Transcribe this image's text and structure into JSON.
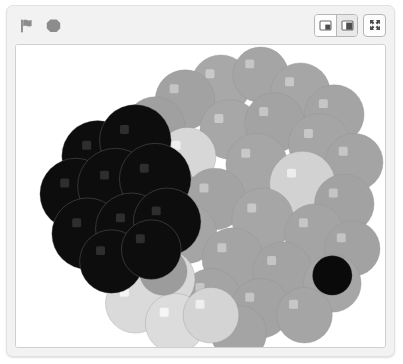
{
  "app": {
    "name": "scratch-stage-panel",
    "background_color": "#f2f2f2",
    "panel_border_color": "#e2e2e2"
  },
  "toolbar": {
    "green_flag": {
      "label": "Go",
      "icon": "green-flag-icon",
      "color": "#8c8c8c"
    },
    "stop": {
      "label": "Stop",
      "icon": "stop-octagon-icon",
      "color": "#8c8c8c"
    },
    "small_stage": {
      "label": "Small stage layout",
      "icon": "small-stage-icon",
      "selected": false
    },
    "large_stage": {
      "label": "Normal stage layout",
      "icon": "large-stage-icon",
      "selected": true
    },
    "fullscreen": {
      "label": "Full screen control",
      "icon": "fullscreen-arrows-icon",
      "selected": false
    }
  },
  "stage": {
    "name": "stage-canvas",
    "background_color": "#ffffff",
    "border_color": "#cfcfcf",
    "width": 371,
    "height": 304,
    "artwork": {
      "title": "Stamped circle cluster",
      "description": "Many overlapping pen-stamped circles in shades of gray, each with a small light square highlight offset up and left of center.",
      "highlight_offset": {
        "x": -11,
        "y": -11
      },
      "highlight_size": 9,
      "palette": {
        "black": "#080808",
        "dark": "#202020",
        "mid_gray": "#9b9b9b",
        "gray": "#a8a8a8",
        "light_gray": "#c2c2c2",
        "pale": "#d9d9d9",
        "near_white": "#efefef",
        "white_tint": "#f7f7f7",
        "outline": "#8f8f8f"
      },
      "stamps": [
        {
          "cx": 206,
          "cy": 40,
          "r": 30,
          "fill": "#a8a8a8",
          "hl": "#c9c9c9"
        },
        {
          "cx": 246,
          "cy": 30,
          "r": 28,
          "fill": "#a5a5a5",
          "hl": "#c6c6c6"
        },
        {
          "cx": 170,
          "cy": 55,
          "r": 30,
          "fill": "#a2a2a2",
          "hl": "#c4c4c4"
        },
        {
          "cx": 286,
          "cy": 48,
          "r": 30,
          "fill": "#a6a6a6",
          "hl": "#c8c8c8"
        },
        {
          "cx": 320,
          "cy": 70,
          "r": 30,
          "fill": "#a4a4a4",
          "hl": "#c6c6c6"
        },
        {
          "cx": 140,
          "cy": 82,
          "r": 30,
          "fill": "#a0a0a0",
          "hl": "#c3c3c3"
        },
        {
          "cx": 215,
          "cy": 85,
          "r": 30,
          "fill": "#a7a7a7",
          "hl": "#c9c9c9"
        },
        {
          "cx": 260,
          "cy": 78,
          "r": 30,
          "fill": "#a3a3a3",
          "hl": "#c5c5c5"
        },
        {
          "cx": 305,
          "cy": 100,
          "r": 31,
          "fill": "#a5a5a5",
          "hl": "#c7c7c7"
        },
        {
          "cx": 340,
          "cy": 118,
          "r": 29,
          "fill": "#a4a4a4",
          "hl": "#c6c6c6"
        },
        {
          "cx": 172,
          "cy": 112,
          "r": 29,
          "fill": "#d7d7d7",
          "hl": "#efefef"
        },
        {
          "cx": 242,
          "cy": 120,
          "r": 31,
          "fill": "#a6a6a6",
          "hl": "#c8c8c8"
        },
        {
          "cx": 288,
          "cy": 140,
          "r": 33,
          "fill": "#d2d2d2",
          "hl": "#ededed"
        },
        {
          "cx": 330,
          "cy": 160,
          "r": 30,
          "fill": "#a2a2a2",
          "hl": "#c4c4c4"
        },
        {
          "cx": 150,
          "cy": 145,
          "r": 30,
          "fill": "#a4a4a4",
          "hl": "#c6c6c6"
        },
        {
          "cx": 200,
          "cy": 155,
          "r": 31,
          "fill": "#a3a3a3",
          "hl": "#c5c5c5"
        },
        {
          "cx": 248,
          "cy": 175,
          "r": 31,
          "fill": "#a6a6a6",
          "hl": "#c8c8c8"
        },
        {
          "cx": 300,
          "cy": 190,
          "r": 30,
          "fill": "#a4a4a4",
          "hl": "#c6c6c6"
        },
        {
          "cx": 338,
          "cy": 205,
          "r": 28,
          "fill": "#a2a2a2",
          "hl": "#c4c4c4"
        },
        {
          "cx": 172,
          "cy": 190,
          "r": 30,
          "fill": "#a5a5a5",
          "hl": "#c7c7c7"
        },
        {
          "cx": 218,
          "cy": 215,
          "r": 31,
          "fill": "#a4a4a4",
          "hl": "#c6c6c6"
        },
        {
          "cx": 268,
          "cy": 228,
          "r": 30,
          "fill": "#a3a3a3",
          "hl": "#c5c5c5"
        },
        {
          "cx": 318,
          "cy": 240,
          "r": 29,
          "fill": "#a6a6a6",
          "hl": "#c8c8c8"
        },
        {
          "cx": 318,
          "cy": 232,
          "r": 20,
          "fill": "#0a0a0a",
          "hl": "#0a0a0a"
        },
        {
          "cx": 196,
          "cy": 255,
          "r": 30,
          "fill": "#a4a4a4",
          "hl": "#c6c6c6"
        },
        {
          "cx": 246,
          "cy": 265,
          "r": 30,
          "fill": "#a3a3a3",
          "hl": "#c5c5c5"
        },
        {
          "cx": 290,
          "cy": 272,
          "r": 28,
          "fill": "#a5a5a5",
          "hl": "#c7c7c7"
        },
        {
          "cx": 224,
          "cy": 290,
          "r": 28,
          "fill": "#a4a4a4",
          "hl": "#c6c6c6"
        },
        {
          "cx": 150,
          "cy": 236,
          "r": 30,
          "fill": "#d8d8d8",
          "hl": "#f2f2f2"
        },
        {
          "cx": 120,
          "cy": 260,
          "r": 30,
          "fill": "#dadada",
          "hl": "#f4f4f4"
        },
        {
          "cx": 160,
          "cy": 280,
          "r": 30,
          "fill": "#dcdcdc",
          "hl": "#f5f5f5"
        },
        {
          "cx": 196,
          "cy": 272,
          "r": 28,
          "fill": "#d4d4d4",
          "hl": "#eeeeee"
        },
        {
          "cx": 148,
          "cy": 228,
          "r": 24,
          "fill": "#9c9c9c",
          "hl": "#bcbcbc"
        },
        {
          "cx": 82,
          "cy": 112,
          "r": 36,
          "fill": "#0d0d0d",
          "hl": "#2e2e2e"
        },
        {
          "cx": 120,
          "cy": 96,
          "r": 36,
          "fill": "#0d0d0d",
          "hl": "#2e2e2e"
        },
        {
          "cx": 60,
          "cy": 150,
          "r": 36,
          "fill": "#0d0d0d",
          "hl": "#2e2e2e"
        },
        {
          "cx": 100,
          "cy": 142,
          "r": 38,
          "fill": "#0d0d0d",
          "hl": "#2e2e2e"
        },
        {
          "cx": 140,
          "cy": 135,
          "r": 36,
          "fill": "#0d0d0d",
          "hl": "#2e2e2e"
        },
        {
          "cx": 72,
          "cy": 190,
          "r": 36,
          "fill": "#0d0d0d",
          "hl": "#2e2e2e"
        },
        {
          "cx": 116,
          "cy": 185,
          "r": 36,
          "fill": "#0d0d0d",
          "hl": "#2e2e2e"
        },
        {
          "cx": 152,
          "cy": 178,
          "r": 34,
          "fill": "#0d0d0d",
          "hl": "#2e2e2e"
        },
        {
          "cx": 96,
          "cy": 218,
          "r": 32,
          "fill": "#0d0d0d",
          "hl": "#2e2e2e"
        },
        {
          "cx": 136,
          "cy": 206,
          "r": 30,
          "fill": "#0d0d0d",
          "hl": "#2e2e2e"
        }
      ]
    }
  }
}
